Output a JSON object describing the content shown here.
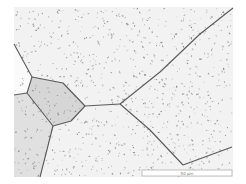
{
  "image": {
    "kind": "optical-micrograph",
    "subject": "polycrystalline metal with grain boundaries and dispersed precipitates",
    "frame": {
      "x": 14,
      "y": 7,
      "width": 219,
      "height": 170
    },
    "background_color": "#ffffff",
    "grain_color": "#f2f2f2",
    "boundary_color": "#5a5a5a",
    "particle_color": "#6e6e6e"
  },
  "grains": [
    {
      "name": "small-central-grain",
      "fill": "#d6d6d6",
      "points": "32,77 63,83 85,106 71,121 53,126 27,93"
    },
    {
      "name": "lower-left-grain",
      "fill": "#e0e0e0",
      "points": "14,95 27,93 53,126 40,177 14,177"
    },
    {
      "name": "left-edge-grain",
      "fill": "#fafafa",
      "points": "14,44 32,77 27,93 14,95"
    }
  ],
  "boundaries": [
    {
      "points": "14,44 32,77"
    },
    {
      "points": "14,95 27,93"
    },
    {
      "points": "32,77 63,83 85,106 71,121 53,126 27,93 32,77"
    },
    {
      "points": "53,126 40,177"
    },
    {
      "points": "85,106 120,104"
    },
    {
      "points": "120,104 160,72 200,34 233,8"
    },
    {
      "points": "120,104 150,130 183,165"
    },
    {
      "points": "183,165 232,147"
    }
  ],
  "scale_bar": {
    "x": 142,
    "y": 170,
    "width": 90,
    "height": 6,
    "label": "50 µm"
  },
  "particles": {
    "count": 900,
    "seed": 7
  }
}
